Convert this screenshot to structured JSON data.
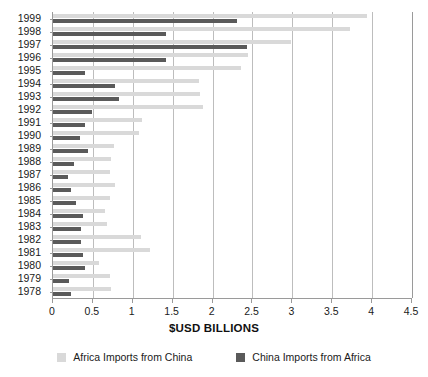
{
  "chart_data": {
    "type": "bar",
    "orientation": "horizontal",
    "title": "",
    "xlabel": "$USD BILLIONS",
    "ylabel": "",
    "xlim": [
      0,
      4.5
    ],
    "xticks": [
      0,
      0.5,
      1,
      1.5,
      2,
      2.5,
      3,
      3.5,
      4,
      4.5
    ],
    "xtick_labels": [
      "0",
      "0.5",
      "1",
      "1.5",
      "2",
      "2.5",
      "3",
      "3.5",
      "4",
      "4.5"
    ],
    "grid": true,
    "grid_axis": "x",
    "legend_position": "bottom",
    "categories": [
      "1999",
      "1998",
      "1997",
      "1996",
      "1995",
      "1994",
      "1993",
      "1992",
      "1991",
      "1990",
      "1989",
      "1988",
      "1987",
      "1986",
      "1985",
      "1984",
      "1983",
      "1982",
      "1981",
      "1980",
      "1979",
      "1978"
    ],
    "series": [
      {
        "name": "Africa Imports from China",
        "color": "#d9d9d9",
        "values": [
          3.94,
          3.72,
          2.98,
          2.44,
          2.36,
          1.83,
          1.84,
          1.88,
          1.12,
          1.08,
          0.76,
          0.73,
          0.72,
          0.78,
          0.72,
          0.65,
          0.68,
          1.1,
          1.21,
          0.58,
          0.72,
          0.73
        ]
      },
      {
        "name": "China Imports from Africa",
        "color": "#5a5a5a",
        "values": [
          2.31,
          1.42,
          2.43,
          1.42,
          0.4,
          0.78,
          0.83,
          0.49,
          0.4,
          0.34,
          0.44,
          0.26,
          0.19,
          0.23,
          0.29,
          0.38,
          0.35,
          0.35,
          0.37,
          0.4,
          0.2,
          0.23
        ]
      }
    ]
  },
  "legend": {
    "items": [
      {
        "label": "Africa Imports from China",
        "swatch": "light"
      },
      {
        "label": "China Imports from Africa",
        "swatch": "dark"
      }
    ]
  },
  "axis": {
    "x_title": "$USD BILLIONS"
  }
}
